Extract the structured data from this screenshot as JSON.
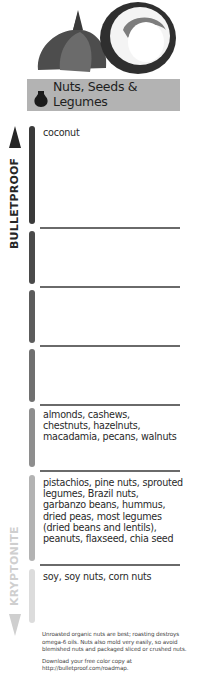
{
  "header": {
    "illustration": "garlic-and-coconut-illustration",
    "title_line1": "Nuts, Seeds &",
    "title_line2": "Legumes",
    "icon": "pot-icon"
  },
  "scale": {
    "top_label": "BULLETPROOF",
    "bottom_label": "KRYPTONITE",
    "top_arrow": "arrow-up-icon",
    "bottom_arrow": "arrow-down-icon"
  },
  "rows": [
    {
      "level": 1,
      "text": "coconut",
      "pill_color": "#3a3a3a"
    },
    {
      "level": 2,
      "text": "",
      "pill_color": "#4a4a4a"
    },
    {
      "level": 3,
      "text": "",
      "pill_color": "#5c5c5c"
    },
    {
      "level": 4,
      "text": "",
      "pill_color": "#707070"
    },
    {
      "level": 5,
      "text": "almonds, cashews, chestnuts, hazelnuts, macadamia, pecans, walnuts",
      "pill_color": "#8e8e8e"
    },
    {
      "level": 6,
      "text": "pistachios, pine nuts, sprouted legumes, Brazil nuts, garbanzo beans, hummus, dried peas, most legumes (dried beans and lentils), peanuts, flaxseed, chia seed",
      "pill_color": "#b3b3b3"
    },
    {
      "level": 7,
      "text": "soy, soy nuts, corn nuts",
      "pill_color": "#dcdcdc"
    }
  ],
  "footer": {
    "note": "Unroasted organic nuts are best; roasting destroys omega-6 oils. Nuts also mold very easily, so avoid blemished nuts and packaged sliced or crushed nuts.",
    "download": "Download your free color copy at http://bulletproof.com/roadmap."
  }
}
